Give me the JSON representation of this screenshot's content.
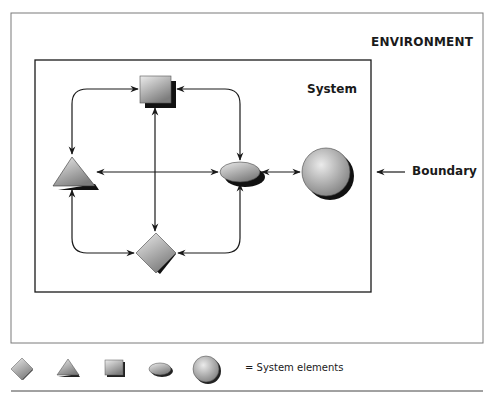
{
  "diagram": {
    "environment_label": "ENVIRONMENT",
    "system_label": "System",
    "boundary_label": "Boundary",
    "elements": [
      {
        "shape": "square",
        "x": 155,
        "y": 89
      },
      {
        "shape": "triangle",
        "x": 72,
        "y": 172
      },
      {
        "shape": "ellipse",
        "x": 240,
        "y": 172
      },
      {
        "shape": "circle",
        "x": 326,
        "y": 172
      },
      {
        "shape": "diamond",
        "x": 156,
        "y": 253
      }
    ],
    "connections": [
      {
        "from": "triangle",
        "to": "square",
        "bidirectional": true
      },
      {
        "from": "square",
        "to": "ellipse",
        "bidirectional": true
      },
      {
        "from": "square",
        "to": "diamond",
        "bidirectional": true
      },
      {
        "from": "triangle",
        "to": "ellipse",
        "bidirectional": true
      },
      {
        "from": "triangle",
        "to": "diamond",
        "bidirectional": true
      },
      {
        "from": "diamond",
        "to": "ellipse",
        "bidirectional": true
      },
      {
        "from": "ellipse",
        "to": "circle",
        "bidirectional": true
      }
    ]
  },
  "legend": {
    "shapes": [
      "diamond",
      "triangle",
      "square",
      "ellipse",
      "circle"
    ],
    "text": "= System elements"
  },
  "colors": {
    "line": "#1a1a1a",
    "fill_light": "#e2e2e2",
    "fill_dark": "#8a8a8a",
    "shadow": "#111111",
    "outer_border": "#777777"
  }
}
